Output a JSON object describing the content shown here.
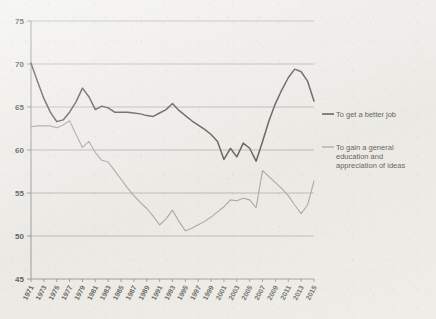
{
  "chart_data": {
    "type": "line",
    "title": "",
    "subtitle": "",
    "xlabel": "",
    "ylabel": "",
    "ylim": [
      45,
      75
    ],
    "yticks": [
      45,
      50,
      55,
      60,
      65,
      70,
      75
    ],
    "grid": true,
    "legend_position": "right",
    "x": [
      1971,
      1972,
      1973,
      1974,
      1975,
      1976,
      1977,
      1978,
      1979,
      1980,
      1981,
      1982,
      1983,
      1984,
      1985,
      1986,
      1987,
      1988,
      1989,
      1990,
      1991,
      1992,
      1993,
      1994,
      1995,
      1996,
      1997,
      1998,
      1999,
      2000,
      2001,
      2002,
      2003,
      2004,
      2005,
      2006,
      2007,
      2008,
      2009,
      2010,
      2011,
      2012,
      2013,
      2014,
      2015
    ],
    "xtick_labels": [
      "1971",
      "1973",
      "1975",
      "1977",
      "1979",
      "1981",
      "1983",
      "1985",
      "1987",
      "1989",
      "1991",
      "1993",
      "1995",
      "1997",
      "1999",
      "2001",
      "2003",
      "2005",
      "2007",
      "2009",
      "2011",
      "2013",
      "2015"
    ],
    "series": [
      {
        "name": "To get a better job",
        "color": "#2b2b2b",
        "values": [
          70.1,
          68.0,
          66.0,
          64.4,
          63.3,
          63.5,
          64.4,
          65.6,
          67.2,
          66.2,
          64.7,
          65.1,
          64.9,
          64.4,
          64.4,
          64.4,
          64.3,
          64.2,
          64.0,
          63.9,
          64.3,
          64.7,
          65.4,
          64.6,
          64.0,
          63.4,
          62.9,
          62.4,
          61.8,
          61.0,
          58.9,
          60.2,
          59.2,
          60.8,
          60.2,
          58.7,
          61.0,
          63.4,
          65.4,
          67.0,
          68.4,
          69.4,
          69.1,
          68.0,
          65.7
        ]
      },
      {
        "name": "To gain a general education and appreciation of ideas",
        "color": "#8e8e8e",
        "values": [
          62.7,
          62.8,
          62.8,
          62.8,
          62.6,
          62.9,
          63.4,
          61.8,
          60.3,
          61.0,
          59.7,
          58.8,
          58.6,
          57.6,
          56.6,
          55.6,
          54.7,
          53.9,
          53.2,
          52.3,
          51.3,
          52.0,
          53.0,
          51.7,
          50.6,
          50.9,
          51.3,
          51.7,
          52.2,
          52.8,
          53.4,
          54.2,
          54.1,
          54.4,
          54.2,
          53.3,
          57.6,
          56.9,
          56.2,
          55.5,
          54.7,
          53.6,
          52.6,
          53.6,
          56.4
        ]
      }
    ]
  },
  "legend": {
    "items": [
      {
        "label": "To get a better job",
        "color": "#2b2b2b"
      },
      {
        "label": "To gain a general education and appreciation of ideas",
        "color": "#8e8e8e"
      }
    ],
    "item2_line1": "To gain a general",
    "item2_line2": "education and",
    "item2_line3": "appreciation of ideas"
  }
}
